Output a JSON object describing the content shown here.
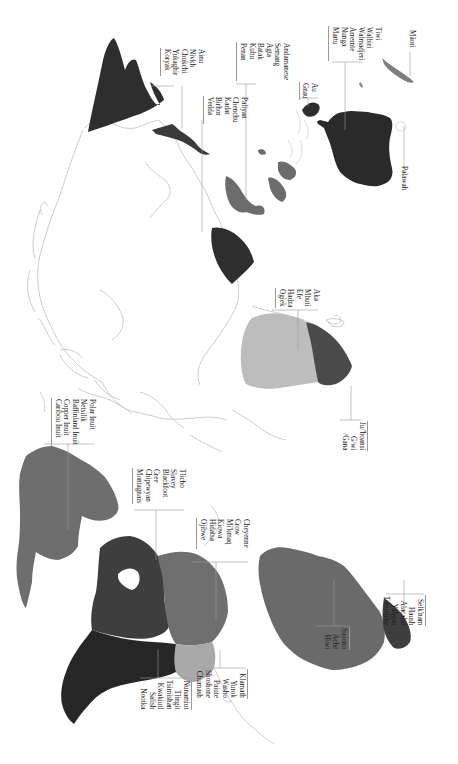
{
  "map": {
    "title": "",
    "orientation": "rotated 90 degrees",
    "colors": {
      "background": "#ffffff",
      "outline": "#b8b8b8",
      "leader_line": "#9a9a9a",
      "darkest": "#2e2e2e",
      "dark": "#3f3f3f",
      "medium": "#6c6c6c",
      "medium_light": "#7e7e7e",
      "light": "#a9a9a9",
      "lightest": "#bdbdbd"
    },
    "regions": [
      {
        "name": "Siberia / Northeast Asia",
        "shade": "darkest"
      },
      {
        "name": "Sakhalin / Amur",
        "shade": "darkest"
      },
      {
        "name": "Indian subcontinent (South India)",
        "shade": "darkest"
      },
      {
        "name": "Southeast Asia / Malay Peninsula",
        "shade": "medium"
      },
      {
        "name": "Philippines / Borneo",
        "shade": "medium"
      },
      {
        "name": "New Guinea tip",
        "shade": "darkest"
      },
      {
        "name": "Australia",
        "shade": "darkest"
      },
      {
        "name": "New Zealand",
        "shade": "medium_light"
      },
      {
        "name": "Central / East Africa",
        "shade": "lightest"
      },
      {
        "name": "Southern Africa (Kalahari)",
        "shade": "dark"
      },
      {
        "name": "Greenland / Arctic Canada",
        "shade": "medium"
      },
      {
        "name": "Subarctic Canada",
        "shade": "dark"
      },
      {
        "name": "Northwest Coast",
        "shade": "darkest"
      },
      {
        "name": "Great Plains / Eastern Woodlands",
        "shade": "medium"
      },
      {
        "name": "Great Basin / California",
        "shade": "light"
      },
      {
        "name": "South America",
        "shade": "medium"
      },
      {
        "name": "Tierra del Fuego / Patagonia",
        "shade": "dark"
      }
    ],
    "labels": {
      "siberia": [
        "Ainu",
        "Nivkh",
        "Chukchi",
        "Yukaghir",
        "Koryak"
      ],
      "south_asia": [
        "Paliyan",
        "Chenchu",
        "Kadar",
        "Birhor",
        "Vedda"
      ],
      "southeast_asia": [
        "Andamanese",
        "Semang",
        "Agta",
        "Batak",
        "Kubu",
        "Penan"
      ],
      "new_guinea": [
        "Au",
        "Gnau"
      ],
      "australia": [
        "Tiwi",
        "Walbiri",
        "Walmadjeri",
        "Arrernte",
        "Nunga",
        "Martu"
      ],
      "new_zealand": [
        "Māori"
      ],
      "tasmania": [
        "Palawah"
      ],
      "central_africa": [
        "Aka",
        "Mbuti",
        "Efe",
        "Hadza",
        "Ogiek"
      ],
      "southern_africa": [
        "Ju/'hoansi",
        "G/wi",
        "/Gana"
      ],
      "arctic": [
        "Polar Inuit",
        "Netsilik",
        "Baffinland Inuit",
        "Copper Inuit",
        "Caribou Inuit"
      ],
      "subarctic": [
        "Tlicho",
        "Slavey",
        "Blackfoot",
        "Cree",
        "Chipewyan",
        "Montagnais"
      ],
      "plains_woodlands": [
        "Cheyenne",
        "Crow",
        "Mi'kmaq",
        "Kiowa",
        "Hidatsa",
        "Ojibwe"
      ],
      "northwest_coast": [
        "Nunamiut",
        "Tlingit",
        "Tsimishan",
        "Kwakiutl",
        "Salish",
        "Nootka"
      ],
      "california_basin": [
        "Klamath",
        "Yurok",
        "Washo",
        "Paiute",
        "Shoshone",
        "Chumash"
      ],
      "south_america": [
        "Siriono",
        "Aché",
        "Hiwi"
      ],
      "patagonia": [
        "Selk'nam",
        "Haush",
        "Alacaluf",
        "Yahgan",
        "Tehuelche"
      ]
    }
  }
}
